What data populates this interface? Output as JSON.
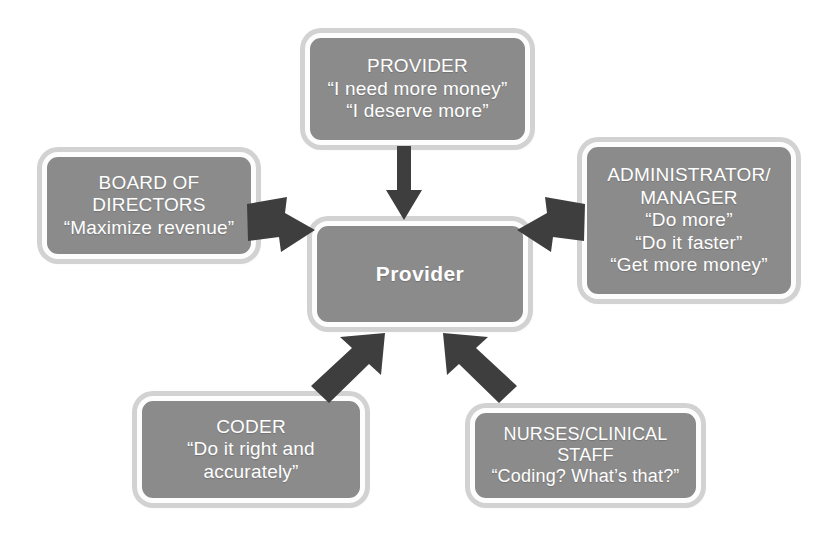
{
  "diagram": {
    "background_color": "#ffffff",
    "node_fill_color": "#8b8b8b",
    "node_border_color": "#fdfdfd",
    "node_outer_shadow_color": "#d2d2d2",
    "node_text_color": "#ffffff",
    "arrow_color": "#3e3e3e",
    "center": {
      "label": "Provider",
      "lines": [
        "Provider"
      ]
    },
    "nodes": [
      {
        "id": "provider",
        "name": "PROVIDER",
        "lines": [
          "PROVIDER",
          "“I need more money”",
          "“I deserve more”"
        ]
      },
      {
        "id": "board",
        "name": "BOARD OF DIRECTORS",
        "lines": [
          "BOARD OF",
          "DIRECTORS",
          "“Maximize revenue”"
        ]
      },
      {
        "id": "admin",
        "name": "ADMINISTRATOR/MANAGER",
        "lines": [
          "ADMINISTRATOR/",
          "MANAGER",
          "“Do more”",
          "“Do it faster”",
          "“Get more money”"
        ]
      },
      {
        "id": "coder",
        "name": "CODER",
        "lines": [
          "CODER",
          "“Do it right and",
          "accurately”"
        ]
      },
      {
        "id": "nurses",
        "name": "NURSES/CLINICAL STAFF",
        "lines": [
          "NURSES/CLINICAL",
          "STAFF",
          "“Coding?  What’s that?”"
        ]
      }
    ],
    "arrows": [
      {
        "id": "provider-to-center",
        "from": "provider",
        "to": "center",
        "direction": "down"
      },
      {
        "id": "board-to-center",
        "from": "board",
        "to": "center",
        "direction": "right-down"
      },
      {
        "id": "admin-to-center",
        "from": "admin",
        "to": "center",
        "direction": "left-down"
      },
      {
        "id": "coder-to-center",
        "from": "coder",
        "to": "center",
        "direction": "up-right"
      },
      {
        "id": "nurses-to-center",
        "from": "nurses",
        "to": "center",
        "direction": "up-left"
      }
    ]
  }
}
